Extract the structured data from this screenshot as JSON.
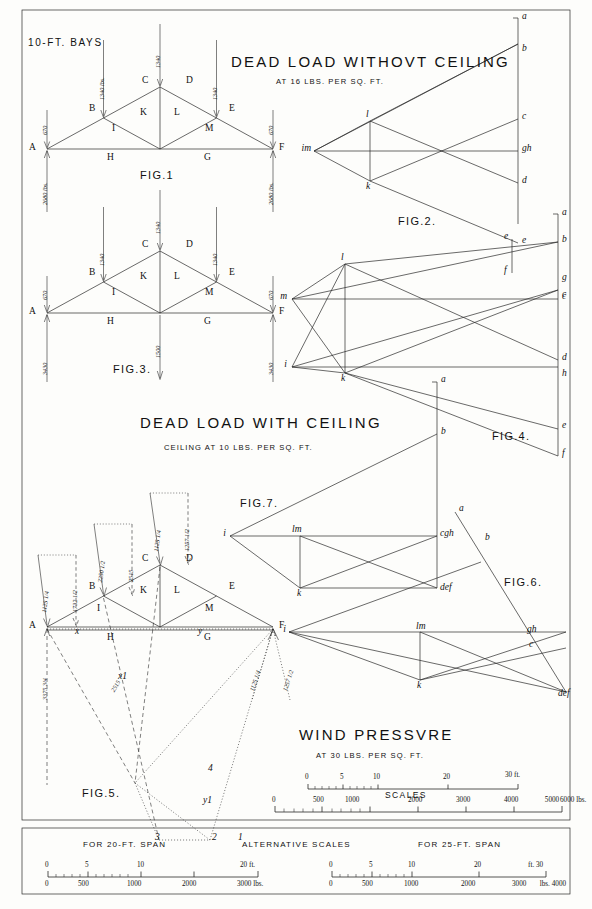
{
  "plate": {
    "bays_note": "10-FT. BAYS",
    "border": true
  },
  "titles": {
    "dead_no_ceiling": "DEAD LOAD WITHOVT CEILING",
    "dead_no_ceiling_sub": "AT 16 LBS. PER SQ. FT.",
    "dead_with_ceiling": "DEAD LOAD WITH CEILING",
    "dead_with_ceiling_sub": "CEILING AT 10 LBS. PER SQ. FT.",
    "wind": "WIND PRESSVRE",
    "wind_sub": "AT 30 LBS. PER SQ. FT."
  },
  "figures": {
    "fig1": "FIG.1",
    "fig2": "FIG.2.",
    "fig3": "FIG.3.",
    "fig4": "FIG.4.",
    "fig5": "FIG.5.",
    "fig6": "FIG.6.",
    "fig7": "FIG.7."
  },
  "fig1": {
    "caption": "FIG.1",
    "frame_letters": [
      "A",
      "B",
      "C",
      "D",
      "E",
      "F"
    ],
    "web_letters": [
      "H",
      "I",
      "K",
      "L",
      "M",
      "G"
    ],
    "loads": {
      "end_left": "670",
      "panel_left": "1340 lbs.",
      "apex": "1340",
      "panel_right": "1340",
      "end_right": "670",
      "reaction_left": "2680 lbs.",
      "reaction_right": "2680 lbs."
    }
  },
  "fig2": {
    "caption": "FIG.2.",
    "points": [
      "a",
      "b",
      "c",
      "d",
      "e",
      "gh",
      "im",
      "l",
      "k"
    ]
  },
  "fig3": {
    "caption": "FIG.3.",
    "frame_letters": [
      "A",
      "B",
      "C",
      "D",
      "E",
      "F"
    ],
    "web_letters": [
      "H",
      "I",
      "K",
      "L",
      "M",
      "G"
    ],
    "loads": {
      "end_left": "670",
      "panel_left": "1340",
      "apex": "1340",
      "panel_right": "1340",
      "end_right": "670",
      "ceiling": "1500",
      "reaction_left": "3430",
      "reaction_right": "3430"
    }
  },
  "fig4": {
    "caption": "FIG.4.",
    "points": [
      "a",
      "b",
      "c",
      "d",
      "e",
      "f",
      "g",
      "h",
      "i",
      "k",
      "l",
      "m"
    ]
  },
  "fig5": {
    "caption": "FIG.5.",
    "frame_letters": [
      "A",
      "B",
      "C",
      "D",
      "E",
      "F"
    ],
    "web_letters": [
      "H",
      "I",
      "K",
      "L",
      "M",
      "G"
    ],
    "construction_letters": [
      "x",
      "y",
      "x1",
      "y1",
      "1",
      "2",
      "3",
      "4"
    ],
    "loads": {
      "end_left_a": "1125 1/4",
      "end_left_b": "1732 1/2",
      "panel_left_a": "2250 1/2",
      "panel_left_b": "2515",
      "apex_a": "1125 1/4",
      "apex_b": "1257 1/2",
      "reaction_left": "3375 3/4",
      "mid_load": "2515",
      "right_a": "1125 1/4",
      "right_b": "1257 1/2"
    }
  },
  "fig6": {
    "caption": "FIG.6.",
    "points": [
      "a",
      "b",
      "gh",
      "c",
      "def",
      "lm",
      "i",
      "k"
    ]
  },
  "fig7": {
    "caption": "FIG.7.",
    "points": [
      "a",
      "b",
      "i",
      "lm",
      "cgh",
      "def",
      "k"
    ]
  },
  "scales": {
    "label": "SCALES",
    "feet": {
      "ticks": [
        "0",
        "5",
        "10",
        "20",
        "30 ft."
      ],
      "unit": "ft."
    },
    "pounds": {
      "ticks": [
        "0",
        "500",
        "1000",
        "2000",
        "3000",
        "4000",
        "5000",
        "6000 lbs."
      ],
      "unit": "lbs."
    }
  },
  "alt_scales": {
    "title": "ALTERNATIVE SCALES",
    "left_title": "FOR 20-FT. SPAN",
    "right_title": "FOR 25-FT. SPAN",
    "left_feet": [
      "0",
      "5",
      "10",
      "20 ft."
    ],
    "left_lbs": [
      "0",
      "500",
      "1000",
      "2000",
      "3000 lbs."
    ],
    "right_feet": [
      "0",
      "5",
      "10",
      "20",
      "ft. 30"
    ],
    "right_lbs": [
      "0",
      "500",
      "1000",
      "2000",
      "3000",
      "lbs. 4000"
    ]
  },
  "colors": {
    "ink": "#1a1a1a",
    "paper": "#fdfdfb",
    "thin": "#333333"
  }
}
